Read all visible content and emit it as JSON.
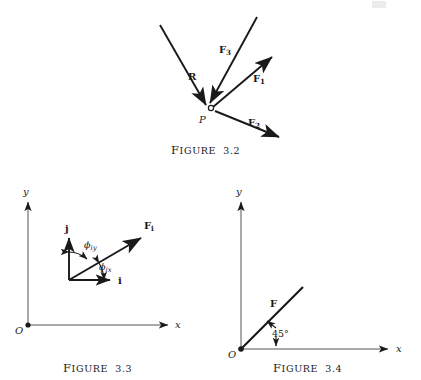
{
  "page": {
    "width": 421,
    "height": 380,
    "background": "#ffffff",
    "ink": "#1a1a1a"
  },
  "figures": [
    {
      "id": "figure-3-2",
      "caption_lead": "F",
      "caption_rest": "IGURE",
      "caption_number": "3.2",
      "caption_full": "FIGURE 3.2",
      "description": "Concurrent force system at point P with resultant R",
      "point_label": "P",
      "vectors": [
        {
          "name": "R",
          "label": "R",
          "label_x": 190,
          "label_y": 77,
          "x1": 160,
          "y1": 25,
          "x2": 209,
          "y2": 108
        },
        {
          "name": "F3",
          "label": "F",
          "sub": "3",
          "label_x": 222,
          "label_y": 49,
          "x1": 255,
          "y1": 18,
          "x2": 211,
          "y2": 106
        },
        {
          "name": "F1",
          "label": "F",
          "sub": "1",
          "label_x": 256,
          "label_y": 78,
          "x1": 212,
          "y1": 107,
          "x2": 274,
          "y2": 55
        },
        {
          "name": "F2",
          "label": "F",
          "sub": "2",
          "label_x": 250,
          "label_y": 122,
          "x1": 214,
          "y1": 110,
          "x2": 281,
          "y2": 138
        }
      ]
    },
    {
      "id": "figure-3-3",
      "caption_lead": "F",
      "caption_rest": "IGURE",
      "caption_number": "3.3",
      "caption_full": "FIGURE 3.3",
      "description": "Unit vectors i and j with direction angles of force F sub i",
      "origin_label": "O",
      "axis_x_label": "x",
      "axis_y_label": "y",
      "unit_vector_i": "i",
      "unit_vector_j": "j",
      "force_label": "F",
      "force_sub": "i",
      "angle_y_label": "ϕ",
      "angle_y_sub": "iy",
      "angle_x_label": "ϕ",
      "angle_x_sub": "ix"
    },
    {
      "id": "figure-3-4",
      "caption_lead": "F",
      "caption_rest": "IGURE",
      "caption_number": "3.4",
      "caption_full": "FIGURE 3.4",
      "description": "Force F acting at 45 degrees from the x axis at origin O",
      "origin_label": "O",
      "axis_x_label": "x",
      "axis_y_label": "y",
      "force_label": "F",
      "angle_label": "45°"
    }
  ]
}
